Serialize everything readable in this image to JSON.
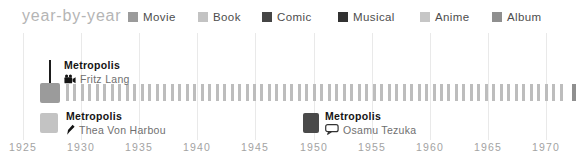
{
  "header": {
    "title": "year-by-year"
  },
  "chart_data": {
    "type": "timeline",
    "title": "year-by-year",
    "legend": [
      {
        "label": "Movie",
        "color": "#9b9b9b"
      },
      {
        "label": "Book",
        "color": "#c3c3c3"
      },
      {
        "label": "Comic",
        "color": "#454545"
      },
      {
        "label": "Musical",
        "color": "#323232"
      },
      {
        "label": "Anime",
        "color": "#c6c6c6"
      },
      {
        "label": "Album",
        "color": "#8f8f8f"
      }
    ],
    "x_axis": {
      "tick_years": [
        1925,
        1930,
        1935,
        1940,
        1945,
        1950,
        1955,
        1960,
        1965,
        1970
      ],
      "range": [
        1925,
        1972
      ],
      "gridlines": true
    },
    "events": [
      {
        "title": "Metropolis",
        "person": "Fritz Lang",
        "category": "Movie",
        "year": 1927,
        "icon": "movie-camera-icon",
        "color": "#9b9b9b",
        "label_side": "above"
      },
      {
        "title": "Metropolis",
        "person": "Thea Von Harbou",
        "category": "Book",
        "year": 1926,
        "icon": "pen-icon",
        "color": "#c3c3c3",
        "label_side": "below"
      },
      {
        "title": "Metropolis",
        "person": "Osamu Tezuka",
        "category": "Comic",
        "year": 1949,
        "icon": "speech-bubble-icon",
        "color": "#4a4a4a",
        "label_side": "below"
      }
    ]
  }
}
